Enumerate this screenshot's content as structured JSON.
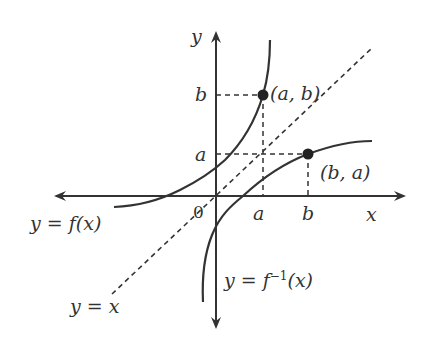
{
  "diagram": {
    "colors": {
      "ink": "#333333",
      "background": "#ffffff"
    },
    "axes": {
      "x_label": "x",
      "y_label": "y",
      "origin_label": "0"
    },
    "ticks": {
      "x": [
        {
          "label": "a"
        },
        {
          "label": "b"
        }
      ],
      "y": [
        {
          "label": "b"
        },
        {
          "label": "a"
        }
      ]
    },
    "points": [
      {
        "label": "(a, b)",
        "on": "f"
      },
      {
        "label": "(b, a)",
        "on": "f_inverse"
      }
    ],
    "curves": {
      "f": {
        "label": "y = f(x)"
      },
      "f_inverse": {
        "label_main": "y = f",
        "label_sup": "−1",
        "label_tail": "(x)"
      },
      "identity": {
        "label": "y = x",
        "style": "dashed"
      }
    }
  }
}
